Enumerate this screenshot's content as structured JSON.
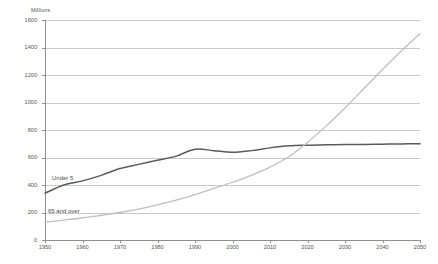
{
  "chart_data": {
    "type": "line",
    "title": "",
    "subtitle": "",
    "xlabel": "",
    "ylabel": "Millions",
    "ylim": [
      0,
      1600
    ],
    "xlim": [
      1950,
      2050
    ],
    "grid": true,
    "legend_position": "inline-annotation",
    "y_ticks": [
      0,
      200,
      400,
      600,
      800,
      1000,
      1200,
      1400,
      1600
    ],
    "y_tick_labels": [
      "0",
      "200",
      "400",
      "600",
      "800",
      "1000",
      "1200",
      "1400",
      "1600"
    ],
    "x_ticks": [
      1950,
      1960,
      1970,
      1980,
      1990,
      2000,
      2010,
      2020,
      2030,
      2040,
      2050
    ],
    "x_tick_labels": [
      "1950",
      "1960",
      "1970",
      "1980",
      "1990",
      "2000",
      "2010",
      "2020",
      "2030",
      "2040",
      "2050"
    ],
    "x": [
      1950,
      1955,
      1960,
      1965,
      1970,
      1975,
      1980,
      1985,
      1990,
      1995,
      2000,
      2005,
      2010,
      2015,
      2020,
      2025,
      2030,
      2035,
      2040,
      2045,
      2050
    ],
    "series": [
      {
        "name": "Under 5",
        "color": "#5a5a5a",
        "values": [
          340,
          400,
          430,
          470,
          520,
          550,
          580,
          610,
          660,
          650,
          638,
          650,
          670,
          685,
          690,
          692,
          694,
          695,
          697,
          699,
          700
        ]
      },
      {
        "name": "65 and over",
        "color": "#bfbfbf",
        "values": [
          130,
          145,
          160,
          180,
          200,
          225,
          255,
          290,
          330,
          375,
          420,
          470,
          530,
          605,
          710,
          830,
          960,
          1100,
          1240,
          1375,
          1500
        ]
      }
    ],
    "annotations": [
      {
        "text": "Under 5",
        "x": 1962,
        "y": 470
      },
      {
        "text": "65 and over",
        "x": 1958,
        "y": 235
      }
    ]
  },
  "axis": {
    "y_title": "Millions"
  }
}
